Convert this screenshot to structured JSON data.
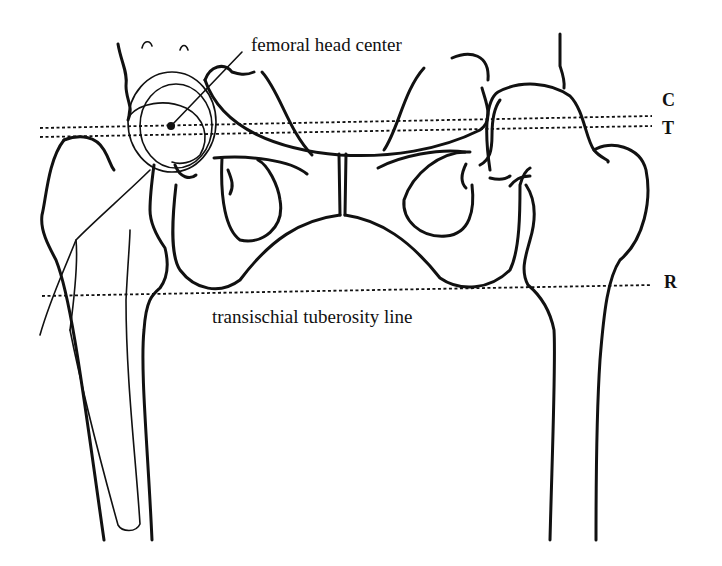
{
  "figure": {
    "annotations": {
      "femoral_head_center": "femoral head center",
      "transischial_line": "transischial tuberosity line"
    },
    "reference_lines": [
      {
        "id": "C",
        "label": "C"
      },
      {
        "id": "T",
        "label": "T"
      },
      {
        "id": "R",
        "label": "R"
      }
    ],
    "colors": {
      "ink": "#111111",
      "background": "#ffffff"
    }
  }
}
